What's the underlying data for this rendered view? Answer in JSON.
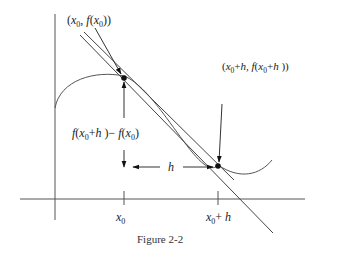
{
  "figure": {
    "caption": "Figure 2-2",
    "line_color": "#444444",
    "point_labels": {
      "p0": "(x0, f(x0))",
      "p1": "(x0+h, f(x0+h))"
    },
    "difference_label": "f(x0+h) − f(x0)",
    "step_label": "h",
    "tick_labels": {
      "x0": "x0",
      "x0h": "x0 + h"
    },
    "elements": [
      "y-axis",
      "x-axis",
      "curve f(x)",
      "tangent line at x0",
      "secant line through x0 and x0+h",
      "point (x0, f(x0))",
      "point (x0+h, f(x0+h))"
    ]
  }
}
